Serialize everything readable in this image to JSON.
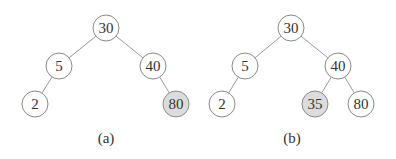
{
  "figures": [
    {
      "caption": "(a)",
      "nodes": [
        {
          "id": "a30",
          "label": "30",
          "x": 106,
          "y": 28,
          "highlight": false
        },
        {
          "id": "a5",
          "label": "5",
          "x": 59,
          "y": 66,
          "highlight": false
        },
        {
          "id": "a40",
          "label": "40",
          "x": 153,
          "y": 66,
          "highlight": false
        },
        {
          "id": "a2",
          "label": "2",
          "x": 35,
          "y": 104,
          "highlight": false
        },
        {
          "id": "a80",
          "label": "80",
          "x": 176,
          "y": 104,
          "highlight": true
        }
      ],
      "edges": [
        [
          "a30",
          "a5"
        ],
        [
          "a30",
          "a40"
        ],
        [
          "a5",
          "a2"
        ],
        [
          "a40",
          "a80"
        ]
      ],
      "caption_pos": {
        "x": 106,
        "y": 143
      }
    },
    {
      "caption": "(b)",
      "nodes": [
        {
          "id": "b30",
          "label": "30",
          "x": 291,
          "y": 28,
          "highlight": false
        },
        {
          "id": "b5",
          "label": "5",
          "x": 245,
          "y": 66,
          "highlight": false
        },
        {
          "id": "b40",
          "label": "40",
          "x": 338,
          "y": 66,
          "highlight": false
        },
        {
          "id": "b2",
          "label": "2",
          "x": 222,
          "y": 104,
          "highlight": false
        },
        {
          "id": "b35",
          "label": "35",
          "x": 315,
          "y": 104,
          "highlight": true
        },
        {
          "id": "b80",
          "label": "80",
          "x": 361,
          "y": 104,
          "highlight": false
        }
      ],
      "edges": [
        [
          "b30",
          "b5"
        ],
        [
          "b30",
          "b40"
        ],
        [
          "b5",
          "b2"
        ],
        [
          "b40",
          "b35"
        ],
        [
          "b40",
          "b80"
        ]
      ],
      "caption_pos": {
        "x": 292,
        "y": 143
      }
    }
  ],
  "style": {
    "node_radius": 13,
    "highlight_color": "#dcdcdc"
  }
}
